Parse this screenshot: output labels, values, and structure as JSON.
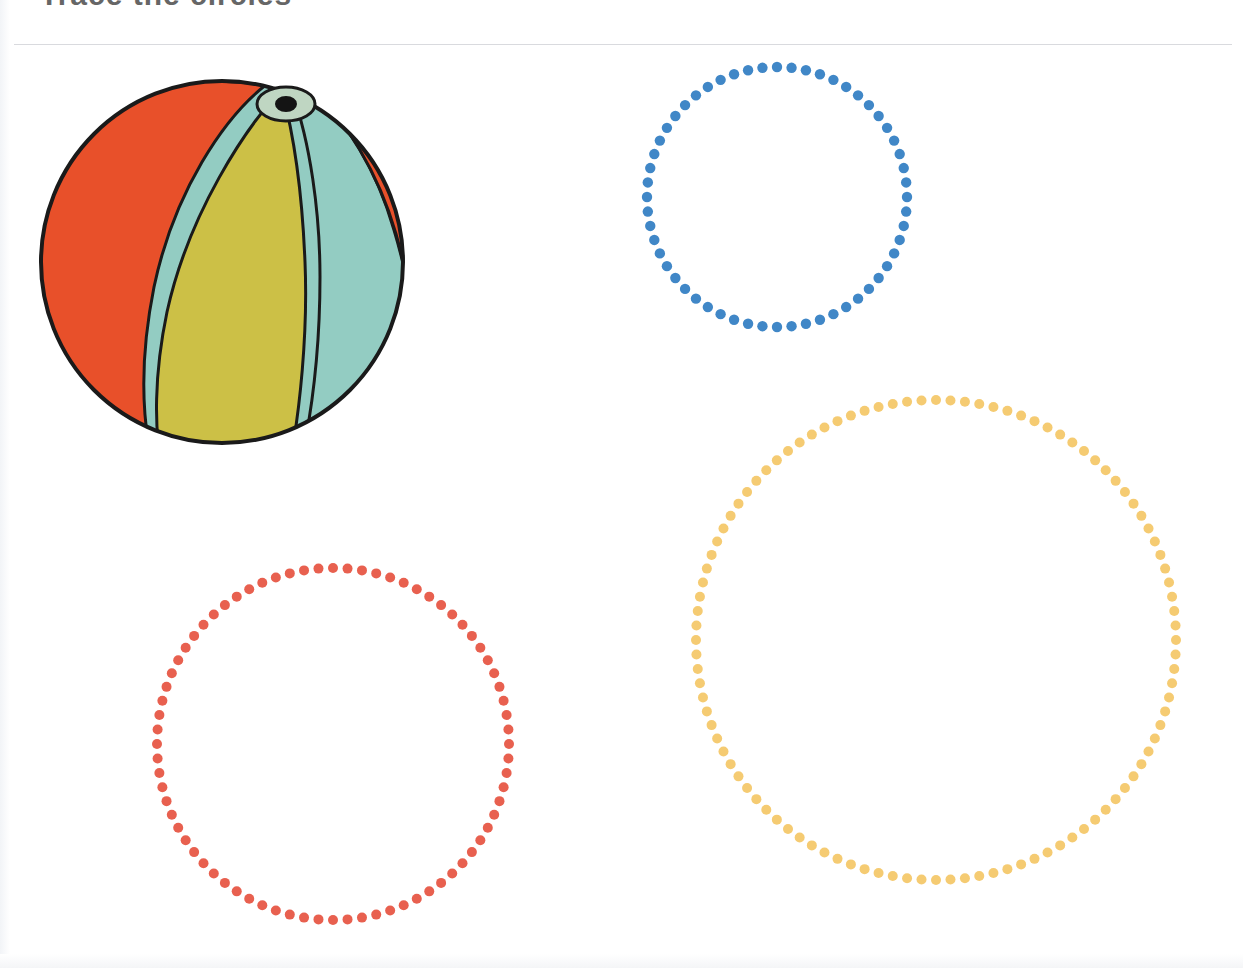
{
  "page": {
    "width": 1243,
    "height": 968,
    "background": "#ffffff",
    "title": "Trace the circles",
    "rule_color": "#d9dade"
  },
  "illustration": {
    "name": "beach-ball",
    "label": "Beach ball",
    "colors": {
      "red": "#E8502A",
      "yellow": "#CCC046",
      "teal": "#93CCC2",
      "outline": "#1a1a1a",
      "valve_ring": "#BFD6C2",
      "valve_center": "#141414"
    },
    "bounds": {
      "x": 24,
      "y": 62,
      "width": 396,
      "height": 396
    }
  },
  "tracing_shapes": [
    {
      "name": "blue-dotted-circle",
      "label": "Small circle",
      "color": "#4087C7",
      "center_x": 777,
      "center_y": 197,
      "radius": 130,
      "dot_radius": 5.2,
      "dot_count": 56
    },
    {
      "name": "red-dotted-circle",
      "label": "Medium circle",
      "color": "#E8604F",
      "center_x": 333,
      "center_y": 744,
      "radius": 176,
      "dot_radius": 5.0,
      "dot_count": 76
    },
    {
      "name": "gold-dotted-circle",
      "label": "Large circle",
      "color": "#F5CB72",
      "center_x": 936,
      "center_y": 640,
      "radius": 240,
      "dot_radius": 5.0,
      "dot_count": 104
    }
  ]
}
